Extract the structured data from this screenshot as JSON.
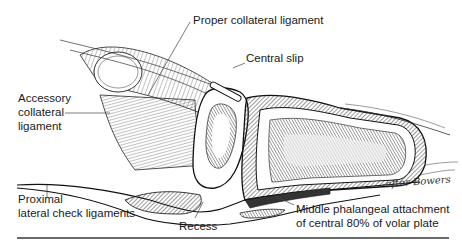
{
  "figure": {
    "labels": {
      "proper_collateral": "Proper collateral ligament",
      "central_slip": "Central slip",
      "accessory_collateral_1": "Accessory",
      "accessory_collateral_2": "collateral",
      "accessory_collateral_3": "ligament",
      "proximal_check_1": "Proximal",
      "proximal_check_2": "lateral check ligaments",
      "recess": "Recess",
      "middle_phalangeal_1": "Middle phalangeal attachment",
      "middle_phalangeal_2": "of central 80% of volar plate"
    },
    "signature": "-after Bowers",
    "colors": {
      "ink": "#1a1a1a",
      "rule": "#6a6a6a",
      "background": "#ffffff"
    }
  }
}
